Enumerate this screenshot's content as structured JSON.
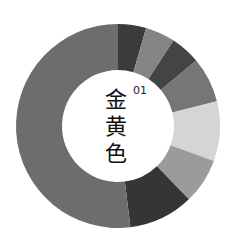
{
  "chart_data": {
    "type": "pie",
    "variant": "donut",
    "index_label": "01",
    "center": [
      118,
      126
    ],
    "outer_radius": 102,
    "inner_radius": 56,
    "start_angle_deg": 0,
    "direction": "clockwise",
    "segments": [
      {
        "label": "segment-1",
        "value": 16,
        "color": "#3b3b3b"
      },
      {
        "label": "segment-2",
        "value": 17,
        "color": "#858585"
      },
      {
        "label": "segment-3",
        "value": 17,
        "color": "#444444"
      },
      {
        "label": "segment-4",
        "value": 26,
        "color": "#767676"
      },
      {
        "label": "segment-5",
        "value": 34,
        "color": "#d5d5d5"
      },
      {
        "label": "segment-6",
        "value": 26,
        "color": "#9b9b9b"
      },
      {
        "label": "segment-7",
        "value": 37,
        "color": "#353535"
      },
      {
        "label": "segment-8",
        "value": 187,
        "color": "#6d6d6d"
      }
    ]
  },
  "center_text": {
    "chars": [
      "金",
      "黄",
      "色"
    ],
    "number": "01"
  }
}
